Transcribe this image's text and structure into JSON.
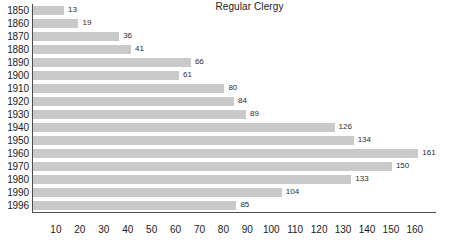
{
  "chart_data": {
    "type": "bar",
    "orientation": "horizontal",
    "title": "Regular Clergy",
    "xlabel": "",
    "ylabel": "",
    "xlim": [
      0,
      168
    ],
    "grid": false,
    "legend": null,
    "bar_color": "#c9c9c9",
    "axis_color": "#4d4d4d",
    "text_color": "#1a1a1a",
    "background_color": "#ffffff",
    "xticks": [
      10,
      20,
      30,
      40,
      50,
      60,
      70,
      80,
      90,
      100,
      110,
      120,
      130,
      140,
      150,
      160
    ],
    "categories": [
      "1850",
      "1860",
      "1870",
      "1880",
      "1890",
      "1900",
      "1910",
      "1920",
      "1930",
      "1940",
      "1950",
      "1960",
      "1970",
      "1980",
      "1990",
      "1996"
    ],
    "values": [
      13,
      19,
      36,
      41,
      66,
      61,
      80,
      84,
      89,
      126,
      134,
      161,
      150,
      133,
      104,
      85
    ],
    "data_labels": [
      "13",
      "19",
      "36",
      "41",
      "66",
      "61",
      "80",
      "84",
      "89",
      "126",
      "134",
      "161",
      "150",
      "133",
      "104",
      "85"
    ]
  }
}
